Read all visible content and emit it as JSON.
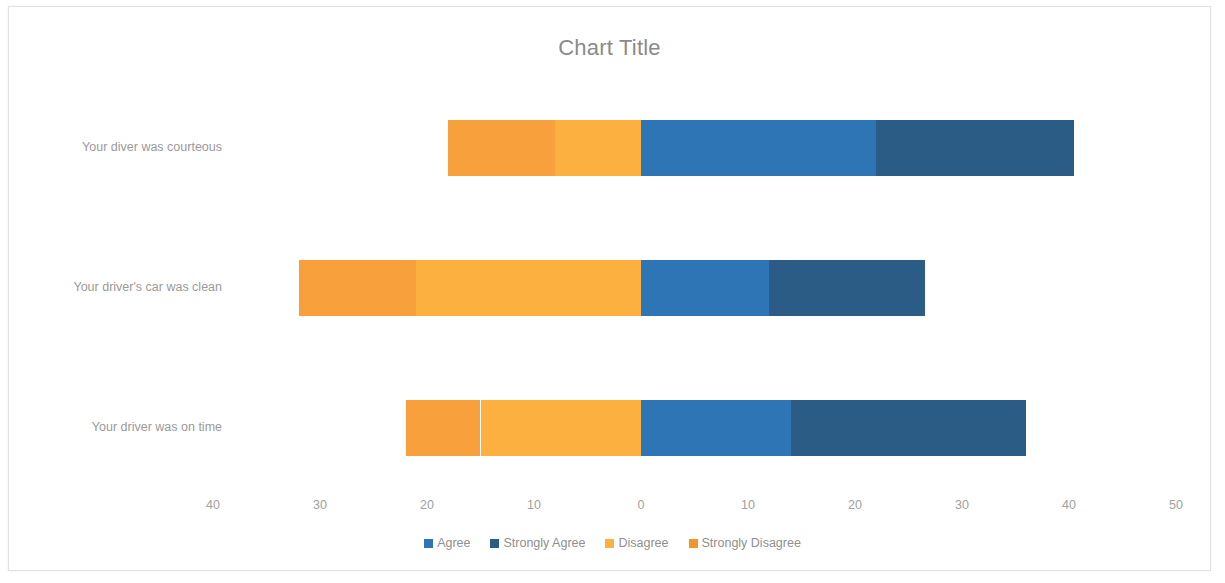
{
  "chart": {
    "title": "Chart Title"
  },
  "chart_data": {
    "type": "bar",
    "subtype": "diverging-stacked-horizontal",
    "title": "Chart Title",
    "xlabel": "",
    "ylabel": "",
    "grid": false,
    "legend_position": "bottom",
    "orientation": "horizontal",
    "axis": {
      "min": -40,
      "max": 50,
      "tick_step": 10,
      "tick_values": [
        -40,
        -30,
        -20,
        -10,
        0,
        10,
        20,
        30,
        40,
        50
      ],
      "tick_labels": [
        "40",
        "30",
        "20",
        "10",
        "0",
        "10",
        "20",
        "30",
        "40",
        "50"
      ]
    },
    "categories": [
      "Your diver was courteous",
      "Your driver's car was clean",
      "Your driver was on time"
    ],
    "series": [
      {
        "name": "Agree",
        "color": "#2E75B6",
        "side": "positive",
        "values": [
          22,
          12,
          14
        ]
      },
      {
        "name": "Strongly Agree",
        "color": "#2A5C86",
        "side": "positive",
        "values": [
          18.5,
          14.5,
          22
        ]
      },
      {
        "name": "Disagree",
        "color": "#FCB040",
        "side": "negative",
        "values": [
          8,
          21,
          15
        ]
      },
      {
        "name": "Strongly Disagree",
        "color": "#F8A03C",
        "side": "negative",
        "values": [
          10,
          11,
          7
        ]
      }
    ]
  },
  "legend": {
    "items": [
      {
        "label": "Agree",
        "color": "#2E75B6"
      },
      {
        "label": "Strongly Agree",
        "color": "#2A5C86"
      },
      {
        "label": "Disagree",
        "color": "#FCB040"
      },
      {
        "label": "Strongly Disagree",
        "color": "#F4942C"
      }
    ]
  },
  "colors": {
    "agree": "#2E75B6",
    "strongly_agree": "#2A5C86",
    "disagree": "#FCB040",
    "strongly_disagree": "#F4942C",
    "title_text": "#8a8a8a",
    "label_text": "#9a9a9a",
    "frame_border": "#e2e2e2",
    "background": "#ffffff"
  }
}
